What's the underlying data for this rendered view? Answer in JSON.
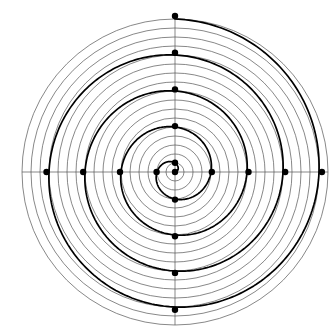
{
  "figure": {
    "title": "",
    "background_color": "#ffffff",
    "width": 333,
    "height": 336
  },
  "chart_data": {
    "type": "line",
    "subtype": "polar-spiral",
    "title": "",
    "subtitle": "",
    "xlabel": "",
    "ylabel": "",
    "grid": true,
    "legend": null,
    "legend_position": "none",
    "coordinate_system": "polar",
    "center": {
      "x": 175,
      "y": 172
    },
    "axis_ranges": {
      "theta_min_deg": 0,
      "theta_max_deg": 1530,
      "r_min": 0,
      "r_max": 8.5
    },
    "polar_grid": {
      "radial_tick_count": 17,
      "radial_tick_values": [
        0.5,
        1.0,
        1.5,
        2.0,
        2.5,
        3.0,
        3.5,
        4.0,
        4.5,
        5.0,
        5.5,
        6.0,
        6.5,
        7.0,
        7.5,
        8.0,
        8.5
      ],
      "radial_tick_pixel_radii": [
        9,
        18,
        27,
        36,
        45,
        54,
        63,
        72,
        81,
        90,
        99,
        108,
        117,
        126,
        135,
        144,
        153
      ],
      "angular_axes_deg": [
        0,
        90,
        180,
        270
      ],
      "grid_color": "#555555",
      "grid_line_width": 0.7
    },
    "series": [
      {
        "name": "spiral",
        "equation": "r = a * theta",
        "a": 0.00566,
        "turns": 4.25,
        "color": "#000000",
        "line_width": 1.7,
        "theta_start_deg": 0,
        "theta_end_deg": 1530,
        "points_polar": [
          {
            "theta_deg": 0,
            "r": 0.0
          },
          {
            "theta_deg": 90,
            "r": 0.51
          },
          {
            "theta_deg": 180,
            "r": 1.02
          },
          {
            "theta_deg": 270,
            "r": 1.53
          },
          {
            "theta_deg": 360,
            "r": 2.04
          },
          {
            "theta_deg": 450,
            "r": 2.55
          },
          {
            "theta_deg": 540,
            "r": 3.06
          },
          {
            "theta_deg": 630,
            "r": 3.57
          },
          {
            "theta_deg": 720,
            "r": 4.08
          },
          {
            "theta_deg": 810,
            "r": 4.59
          },
          {
            "theta_deg": 900,
            "r": 5.1
          },
          {
            "theta_deg": 990,
            "r": 5.61
          },
          {
            "theta_deg": 1080,
            "r": 6.12
          },
          {
            "theta_deg": 1170,
            "r": 6.63
          },
          {
            "theta_deg": 1260,
            "r": 7.14
          },
          {
            "theta_deg": 1350,
            "r": 7.65
          },
          {
            "theta_deg": 1440,
            "r": 8.16
          },
          {
            "theta_deg": 1530,
            "r": 8.67
          }
        ]
      }
    ],
    "markers": {
      "shape": "circle",
      "color": "#000000",
      "radius_px": 3.2,
      "description": "intersection points of the spiral with the horizontal and vertical axes",
      "points": [
        {
          "label": "m1",
          "theta_deg": 0,
          "r": 0.0,
          "x_px": 175.0,
          "y_px": 172.0
        },
        {
          "label": "m2",
          "theta_deg": 90,
          "r": 0.51,
          "x_px": 175.0,
          "y_px": 162.8
        },
        {
          "label": "m3",
          "theta_deg": 180,
          "r": 1.02,
          "x_px": 156.6,
          "y_px": 172.0
        },
        {
          "label": "m4",
          "theta_deg": 270,
          "r": 1.53,
          "x_px": 175.0,
          "y_px": 199.6
        },
        {
          "label": "m5",
          "theta_deg": 360,
          "r": 2.04,
          "x_px": 211.8,
          "y_px": 172.0
        },
        {
          "label": "m6",
          "theta_deg": 450,
          "r": 2.55,
          "x_px": 175.0,
          "y_px": 126.1
        },
        {
          "label": "m7",
          "theta_deg": 540,
          "r": 3.06,
          "x_px": 120.0,
          "y_px": 172.0
        },
        {
          "label": "m8",
          "theta_deg": 630,
          "r": 3.57,
          "x_px": 175.0,
          "y_px": 236.3
        },
        {
          "label": "m9",
          "theta_deg": 720,
          "r": 4.08,
          "x_px": 248.5,
          "y_px": 172.0
        },
        {
          "label": "m10",
          "theta_deg": 810,
          "r": 4.59,
          "x_px": 175.0,
          "y_px": 89.4
        },
        {
          "label": "m11",
          "theta_deg": 900,
          "r": 5.1,
          "x_px": 83.2,
          "y_px": 172.0
        },
        {
          "label": "m12",
          "theta_deg": 990,
          "r": 5.61,
          "x_px": 175.0,
          "y_px": 272.9
        },
        {
          "label": "m13",
          "theta_deg": 1080,
          "r": 6.12,
          "x_px": 285.2,
          "y_px": 172.0
        },
        {
          "label": "m14",
          "theta_deg": 1170,
          "r": 6.63,
          "x_px": 175.0,
          "y_px": 52.7
        },
        {
          "label": "m15",
          "theta_deg": 1260,
          "r": 7.14,
          "x_px": 46.5,
          "y_px": 172.0
        },
        {
          "label": "m16",
          "theta_deg": 1350,
          "r": 7.65,
          "x_px": 175.0,
          "y_px": 309.7
        },
        {
          "label": "m17",
          "theta_deg": 1440,
          "r": 8.16,
          "x_px": 321.9,
          "y_px": 172.0
        },
        {
          "label": "m18",
          "theta_deg": 1530,
          "r": 8.67,
          "x_px": 175.0,
          "y_px": 15.9
        }
      ]
    },
    "annotations": []
  }
}
